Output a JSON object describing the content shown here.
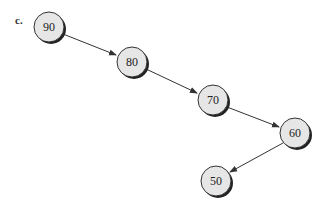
{
  "diagram": {
    "label": "c.",
    "type": "linked-list / degenerate binary tree",
    "nodes": [
      {
        "id": "n90",
        "value": "90",
        "cx": 49,
        "cy": 27
      },
      {
        "id": "n80",
        "value": "80",
        "cx": 132,
        "cy": 62
      },
      {
        "id": "n70",
        "value": "70",
        "cx": 213,
        "cy": 100
      },
      {
        "id": "n60",
        "value": "60",
        "cx": 295,
        "cy": 133
      },
      {
        "id": "n50",
        "value": "50",
        "cx": 216,
        "cy": 181
      }
    ],
    "edges": [
      {
        "from": "90",
        "to": "80"
      },
      {
        "from": "80",
        "to": "70"
      },
      {
        "from": "70",
        "to": "60"
      },
      {
        "from": "60",
        "to": "50"
      }
    ],
    "colors": {
      "node_fill": "#e6e6e6",
      "node_stroke": "#333333",
      "shadow": "#222222",
      "edge": "#333333"
    }
  }
}
